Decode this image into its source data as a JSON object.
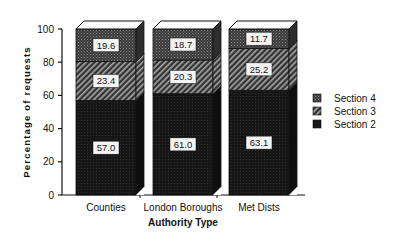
{
  "chart_data": {
    "type": "bar",
    "stacked": true,
    "style": "3d",
    "title": "",
    "xlabel": "Authority Type",
    "ylabel": "Percentage of requests",
    "ylim": [
      0,
      100
    ],
    "yticks": [
      0,
      20,
      40,
      60,
      80,
      100
    ],
    "grid": false,
    "legend_position": "right",
    "categories": [
      "Counties",
      "London Boroughs",
      "Met Dists"
    ],
    "series": [
      {
        "name": "Section 2",
        "values": [
          57.0,
          61.0,
          63.1
        ],
        "pattern": "solid-dark"
      },
      {
        "name": "Section 3",
        "values": [
          23.4,
          20.3,
          25.2
        ],
        "pattern": "diagonal-hatch"
      },
      {
        "name": "Section 4",
        "values": [
          19.6,
          18.7,
          11.7
        ],
        "pattern": "crosshatch"
      }
    ],
    "legend": [
      "Section 4",
      "Section 3",
      "Section 2"
    ]
  },
  "colors": {
    "section2": "#1a1a1a",
    "section3_bg": "#3a3a3a",
    "section3_line": "#9a9a9a",
    "section4": "#4a4a4a",
    "label_bg": "#f4f4f4"
  }
}
